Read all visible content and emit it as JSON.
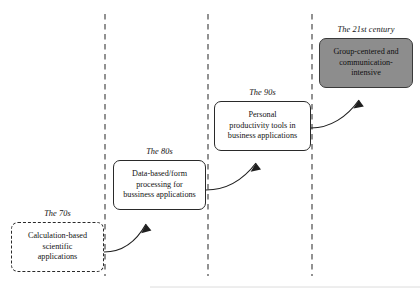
{
  "diagram": {
    "type": "staircase-timeline",
    "title": "",
    "background_color": "#ffffff",
    "text_color": "#131313",
    "line_color": "#2a2a2a",
    "divider_color": "#4a4a4a",
    "filled_box_color": "#8d8d8d",
    "baseline_color": "#d8d8d8",
    "dividers": [
      {
        "name": "divider-1",
        "x": 105,
        "y_top": 14,
        "y_bottom": 276
      },
      {
        "name": "divider-2",
        "x": 208,
        "y_top": 14,
        "y_bottom": 276
      },
      {
        "name": "divider-3",
        "x": 312,
        "y_top": 14,
        "y_bottom": 276
      }
    ],
    "stages": [
      {
        "id": "stage-70s",
        "era": "The 70s",
        "text": "Calculation-based scientific applications",
        "lines": [
          "Calculation-based",
          "scientific",
          "applications"
        ],
        "style": "dashed",
        "filled": false,
        "x": 11,
        "y": 222,
        "width": 93,
        "height": 50,
        "label_x": 11,
        "label_y": 209,
        "label_width": 93
      },
      {
        "id": "stage-80s",
        "era": "The 80s",
        "text": "Data-based/form processing for bussiness applications",
        "lines": [
          "Data-based/form",
          "processing for",
          "bussiness applications"
        ],
        "style": "solid",
        "filled": false,
        "x": 113,
        "y": 160,
        "width": 93,
        "height": 50,
        "label_x": 113,
        "label_y": 147,
        "label_width": 93
      },
      {
        "id": "stage-90s",
        "era": "The 90s",
        "text": "Personal productivity tools in business applications",
        "lines": [
          "Personal",
          "productivity tools in",
          "business applications"
        ],
        "style": "solid",
        "filled": false,
        "x": 214,
        "y": 101,
        "width": 97,
        "height": 50,
        "label_x": 214,
        "label_y": 88,
        "label_width": 97
      },
      {
        "id": "stage-21st",
        "era": "The 21st century",
        "text": "Group-centered and communication-intensive",
        "lines": [
          "Group-centered and",
          "communication-",
          "intensive"
        ],
        "style": "filled",
        "filled": true,
        "x": 319,
        "y": 38,
        "width": 94,
        "height": 50,
        "label_x": 319,
        "label_y": 25,
        "label_width": 94
      }
    ],
    "arrows": [
      {
        "name": "arrow-70s-to-80s",
        "from_stage": "stage-70s",
        "to_stage": "stage-80s",
        "path": "M 104 252 C 122 252 136 242 146 224",
        "head": "M 146 224 L 142.5 232.5 L 151.5 230.5 Z"
      },
      {
        "name": "arrow-80s-to-90s",
        "from_stage": "stage-80s",
        "to_stage": "stage-90s",
        "path": "M 206 190 C 226 190 243 180 256 163",
        "head": "M 256 163 L 251.5 171 L 260.5 169.5 Z"
      },
      {
        "name": "arrow-90s-to-21st",
        "from_stage": "stage-90s",
        "to_stage": "stage-21st",
        "path": "M 311 128 C 330 128 347 117 359 100",
        "head": "M 359 100 L 354 107.5 L 363.5 106.5 Z"
      }
    ],
    "baseline": {
      "name": "bottom-rule",
      "x1": 150,
      "x2": 420,
      "y": 287
    }
  }
}
